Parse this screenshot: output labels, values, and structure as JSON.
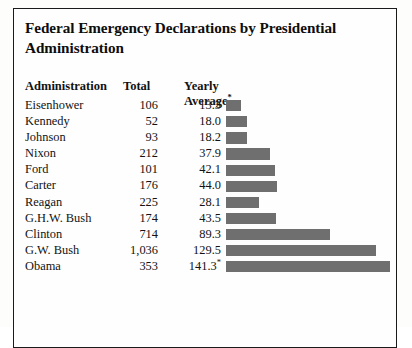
{
  "figure": {
    "title": "Federal Emergency Declarations by Presidential Administration",
    "border_color": "#1a1a1a",
    "background": "#fefefe"
  },
  "table": {
    "columns": {
      "administration": "Administration",
      "total": "Total",
      "yearly_average": "Yearly Average",
      "yearly_average_footnote_marker": "*"
    }
  },
  "chart_data": {
    "type": "bar",
    "title": "Federal Emergency Declarations by Presidential Administration",
    "xlabel": "",
    "ylabel": "",
    "orientation": "horizontal",
    "bar_color": "#6f6f6f",
    "value_field": "yearly_average",
    "xlim": [
      0,
      150
    ],
    "grid": false,
    "legend": false,
    "categories": [
      "Eisenhower",
      "Kennedy",
      "Johnson",
      "Nixon",
      "Ford",
      "Carter",
      "Reagan",
      "G.H.W. Bush",
      "Clinton",
      "G.W. Bush",
      "Obama"
    ],
    "values": [
      13.3,
      18.0,
      18.2,
      37.9,
      42.1,
      44.0,
      28.1,
      43.5,
      89.3,
      129.5,
      141.3
    ],
    "series": [
      {
        "name": "Total",
        "values": [
          106,
          52,
          93,
          212,
          101,
          176,
          225,
          174,
          714,
          1036,
          353
        ]
      },
      {
        "name": "Yearly Average",
        "values": [
          13.3,
          18.0,
          18.2,
          37.9,
          42.1,
          44.0,
          28.1,
          43.5,
          89.3,
          129.5,
          141.3
        ]
      }
    ],
    "rows": [
      {
        "administration": "Eisenhower",
        "total": "106",
        "yearly_average": "13.3",
        "bar": 13.3,
        "note": ""
      },
      {
        "administration": "Kennedy",
        "total": "52",
        "yearly_average": "18.0",
        "bar": 18.0,
        "note": ""
      },
      {
        "administration": "Johnson",
        "total": "93",
        "yearly_average": "18.2",
        "bar": 18.2,
        "note": ""
      },
      {
        "administration": "Nixon",
        "total": "212",
        "yearly_average": "37.9",
        "bar": 37.9,
        "note": ""
      },
      {
        "administration": "Ford",
        "total": "101",
        "yearly_average": "42.1",
        "bar": 42.1,
        "note": ""
      },
      {
        "administration": "Carter",
        "total": "176",
        "yearly_average": "44.0",
        "bar": 44.0,
        "note": ""
      },
      {
        "administration": "Reagan",
        "total": "225",
        "yearly_average": "28.1",
        "bar": 28.1,
        "note": ""
      },
      {
        "administration": "G.H.W. Bush",
        "total": "174",
        "yearly_average": "43.5",
        "bar": 43.5,
        "note": ""
      },
      {
        "administration": "Clinton",
        "total": "714",
        "yearly_average": "89.3",
        "bar": 89.3,
        "note": ""
      },
      {
        "administration": "G.W. Bush",
        "total": "1,036",
        "yearly_average": "129.5",
        "bar": 129.5,
        "note": ""
      },
      {
        "administration": "Obama",
        "total": "353",
        "yearly_average": "141.3",
        "bar": 141.3,
        "note": "*"
      }
    ]
  }
}
